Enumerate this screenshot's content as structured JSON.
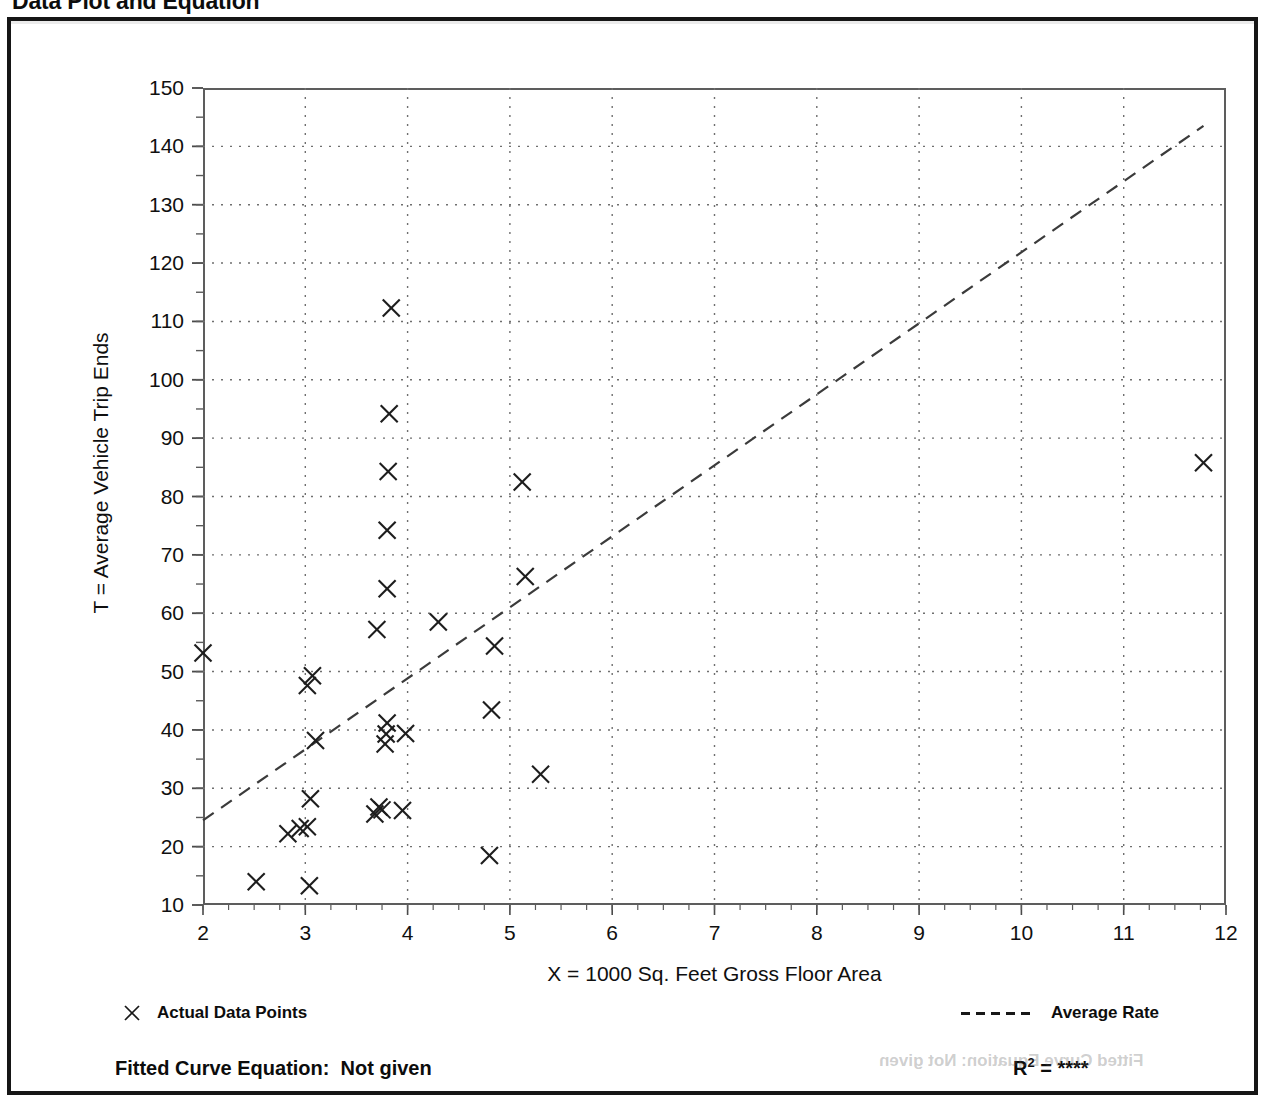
{
  "page": {
    "title": "Data Plot and Equation"
  },
  "axes": {
    "x_title": "X = 1000 Sq. Feet Gross Floor Area",
    "y_title": "T = Average Vehicle Trip Ends",
    "x_ticks": [
      "2",
      "3",
      "4",
      "5",
      "6",
      "7",
      "8",
      "9",
      "10",
      "11",
      "12"
    ],
    "y_ticks": [
      "150",
      "140",
      "130",
      "120",
      "110",
      "100",
      "90",
      "80",
      "70",
      "60",
      "50",
      "40",
      "30",
      "20",
      "10"
    ]
  },
  "legend": {
    "actual_marker": "x-marker-icon",
    "actual_label": "Actual Data Points",
    "average_marker": "dashed-line-icon",
    "average_label": "Average Rate"
  },
  "footer": {
    "fitted_label": "Fitted Curve Equation:",
    "fitted_value": "Not given",
    "r2_label": "R",
    "r2_exponent": "2",
    "r2_equals": "=",
    "r2_value": "****",
    "ghost_text": "Fitted Curve Equation:  Not given"
  },
  "chart_data": {
    "type": "scatter",
    "title": "Data Plot and Equation",
    "xlabel": "X = 1000 Sq. Feet Gross Floor Area",
    "ylabel": "T = Average Vehicle Trip Ends",
    "xlim": [
      2,
      12
    ],
    "ylim": [
      10,
      150
    ],
    "x_major_step": 1,
    "x_minor_step": 0.25,
    "y_major_step": 10,
    "y_minor_step": 5,
    "grid": true,
    "grid_style": "dotted",
    "legend_position": "below-plot",
    "series": [
      {
        "name": "Actual Data Points",
        "marker": "x",
        "points": [
          [
            2.0,
            53.2
          ],
          [
            2.52,
            14.0
          ],
          [
            2.83,
            22.2
          ],
          [
            2.95,
            23.1
          ],
          [
            3.02,
            23.4
          ],
          [
            3.02,
            47.6
          ],
          [
            3.04,
            13.3
          ],
          [
            3.05,
            28.2
          ],
          [
            3.07,
            49.3
          ],
          [
            3.1,
            38.2
          ],
          [
            3.68,
            25.6
          ],
          [
            3.7,
            57.2
          ],
          [
            3.72,
            26.8
          ],
          [
            3.75,
            26.3
          ],
          [
            3.78,
            37.6
          ],
          [
            3.79,
            39.3
          ],
          [
            3.8,
            41.2
          ],
          [
            3.8,
            64.2
          ],
          [
            3.8,
            74.2
          ],
          [
            3.81,
            84.3
          ],
          [
            3.82,
            94.2
          ],
          [
            3.84,
            112.3
          ],
          [
            3.95,
            26.2
          ],
          [
            3.98,
            39.4
          ],
          [
            4.3,
            58.5
          ],
          [
            4.8,
            18.5
          ],
          [
            4.82,
            43.4
          ],
          [
            4.85,
            54.4
          ],
          [
            5.12,
            82.5
          ],
          [
            5.15,
            66.3
          ],
          [
            5.3,
            32.4
          ],
          [
            11.78,
            85.8
          ]
        ]
      },
      {
        "name": "Average Rate",
        "type": "line",
        "style": "dashed",
        "endpoints": [
          [
            2.0,
            24.5
          ],
          [
            11.78,
            143.5
          ]
        ],
        "slope": 12.17,
        "intercept": 0.16
      }
    ]
  }
}
